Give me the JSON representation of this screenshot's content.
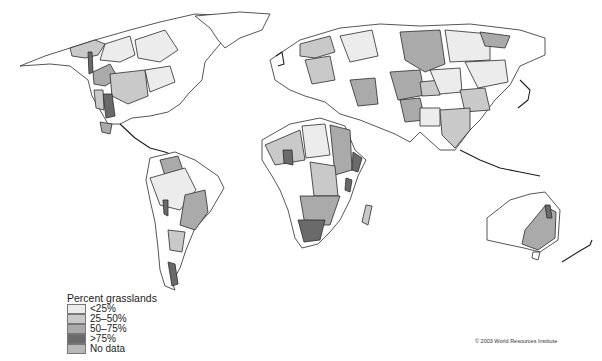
{
  "map": {
    "title": "Percent grasslands",
    "credit": "© 2003 World Resources Institute",
    "colors": {
      "lt25": "#ececec",
      "25to50": "#c9c9c9",
      "50to75": "#aaaaaa",
      "gt75": "#6a6a6a",
      "nodata": "#b8b8b8",
      "land": "#ffffff",
      "ocean": "#ffffff"
    }
  },
  "legend": {
    "title": "Percent grasslands",
    "items": [
      {
        "label": "<25%",
        "color": "#ececec"
      },
      {
        "label": "25–50%",
        "color": "#c9c9c9"
      },
      {
        "label": "50–75%",
        "color": "#aaaaaa"
      },
      {
        "label": ">75%",
        "color": "#6a6a6a"
      },
      {
        "label": "No data",
        "color": "#b8b8b8"
      }
    ]
  },
  "credit": {
    "text": "© 2003 World Resources Institute"
  }
}
